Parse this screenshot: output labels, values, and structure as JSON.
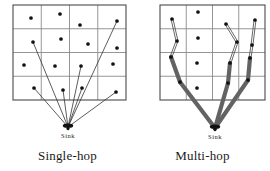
{
  "figure": {
    "title": "",
    "background": "#ffffff",
    "width": 270,
    "height": 171
  },
  "colors": {
    "grid_line": "#8a8a8a",
    "grid_border": "#4a4a4a",
    "node": "#111111",
    "single_hop_link": "#333333",
    "multi_hop_thick_link": "#636363",
    "multi_hop_thin_link": "#4d4d4d",
    "text": "#1a1a1a"
  },
  "panels": [
    {
      "id": "single-hop",
      "caption": "Single-hop",
      "sink_label": "Sink",
      "grid": {
        "cols": 4,
        "rows": 4,
        "x": 13,
        "y": 5,
        "w": 113,
        "h": 95
      },
      "sink": {
        "x": 68,
        "y": 127
      },
      "nodes": [
        {
          "id": "n1",
          "x": 31,
          "y": 18,
          "connected": false
        },
        {
          "id": "n2",
          "x": 60,
          "y": 14,
          "connected": false
        },
        {
          "id": "n3",
          "x": 80,
          "y": 25,
          "connected": false
        },
        {
          "id": "n4",
          "x": 117,
          "y": 21,
          "connected": true
        },
        {
          "id": "n5",
          "x": 33,
          "y": 42,
          "connected": true
        },
        {
          "id": "n6",
          "x": 61,
          "y": 39,
          "connected": false
        },
        {
          "id": "n7",
          "x": 88,
          "y": 44,
          "connected": false
        },
        {
          "id": "n8",
          "x": 117,
          "y": 48,
          "connected": false
        },
        {
          "id": "n9",
          "x": 24,
          "y": 65,
          "connected": false
        },
        {
          "id": "n10",
          "x": 55,
          "y": 66,
          "connected": false
        },
        {
          "id": "n11",
          "x": 81,
          "y": 66,
          "connected": true
        },
        {
          "id": "n12",
          "x": 113,
          "y": 64,
          "connected": false
        },
        {
          "id": "n13",
          "x": 34,
          "y": 88,
          "connected": true
        },
        {
          "id": "n14",
          "x": 63,
          "y": 90,
          "connected": true
        },
        {
          "id": "n15",
          "x": 82,
          "y": 88,
          "connected": true
        },
        {
          "id": "n16",
          "x": 116,
          "y": 92,
          "connected": true
        }
      ],
      "links": [
        {
          "from": "n4",
          "to": "sink",
          "style": "thin"
        },
        {
          "from": "n5",
          "to": "sink",
          "style": "thin"
        },
        {
          "from": "n11",
          "to": "sink",
          "style": "thin"
        },
        {
          "from": "n13",
          "to": "sink",
          "style": "thin"
        },
        {
          "from": "n14",
          "to": "sink",
          "style": "thin"
        },
        {
          "from": "n15",
          "to": "sink",
          "style": "thin"
        },
        {
          "from": "n16",
          "to": "sink",
          "style": "thin"
        }
      ]
    },
    {
      "id": "multi-hop",
      "caption": "Multi-hop",
      "sink_label": "Sink",
      "grid": {
        "cols": 4,
        "rows": 4,
        "x": 25,
        "y": 5,
        "w": 105,
        "h": 95
      },
      "sink": {
        "x": 80,
        "y": 128
      },
      "nodes": [
        {
          "id": "m1",
          "x": 37,
          "y": 19,
          "connected": true
        },
        {
          "id": "m2",
          "x": 63,
          "y": 12,
          "connected": false
        },
        {
          "id": "m3",
          "x": 91,
          "y": 24,
          "connected": true
        },
        {
          "id": "m4",
          "x": 120,
          "y": 20,
          "connected": true
        },
        {
          "id": "m5",
          "x": 42,
          "y": 41,
          "connected": true
        },
        {
          "id": "m6",
          "x": 63,
          "y": 38,
          "connected": false
        },
        {
          "id": "m7",
          "x": 102,
          "y": 42,
          "connected": true
        },
        {
          "id": "m8",
          "x": 117,
          "y": 45,
          "connected": true
        },
        {
          "id": "m9",
          "x": 36,
          "y": 57,
          "connected": true
        },
        {
          "id": "m10",
          "x": 62,
          "y": 63,
          "connected": false
        },
        {
          "id": "m11",
          "x": 95,
          "y": 63,
          "connected": true
        },
        {
          "id": "m12",
          "x": 115,
          "y": 58,
          "connected": true
        },
        {
          "id": "m13",
          "x": 45,
          "y": 82,
          "connected": true
        },
        {
          "id": "m14",
          "x": 62,
          "y": 88,
          "connected": false
        },
        {
          "id": "m15",
          "x": 93,
          "y": 83,
          "connected": true
        },
        {
          "id": "m16",
          "x": 113,
          "y": 80,
          "connected": true
        }
      ],
      "links": [
        {
          "from": "m1",
          "to": "m5",
          "style": "thin"
        },
        {
          "from": "m5",
          "to": "m9",
          "style": "thin"
        },
        {
          "from": "m9",
          "to": "m13",
          "style": "thick"
        },
        {
          "from": "m13",
          "to": "sink",
          "style": "thick"
        },
        {
          "from": "m3",
          "to": "m7",
          "style": "thin"
        },
        {
          "from": "m7",
          "to": "m11",
          "style": "thin"
        },
        {
          "from": "m11",
          "to": "m15",
          "style": "thick"
        },
        {
          "from": "m15",
          "to": "sink",
          "style": "thick"
        },
        {
          "from": "m4",
          "to": "m8",
          "style": "thin"
        },
        {
          "from": "m8",
          "to": "m12",
          "style": "thin"
        },
        {
          "from": "m12",
          "to": "m16",
          "style": "thick"
        },
        {
          "from": "m16",
          "to": "sink",
          "style": "thick"
        }
      ]
    }
  ]
}
